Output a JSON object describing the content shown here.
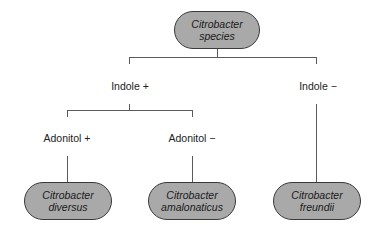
{
  "diagram": {
    "root": {
      "line1": "Citrobacter",
      "line2": "species"
    },
    "branches": {
      "indole_pos": "Indole +",
      "indole_neg": "Indole −",
      "adonitol_pos": "Adonitol +",
      "adonitol_neg": "Adonitol −"
    },
    "leaves": [
      {
        "line1": "Citrobacter",
        "line2": "diversus"
      },
      {
        "line1": "Citrobacter",
        "line2": "amalonaticus"
      },
      {
        "line1": "Citrobacter",
        "line2": "freundii"
      }
    ],
    "colors": {
      "node_fill": "#a9a9a9",
      "line": "#5a5a5a"
    }
  }
}
